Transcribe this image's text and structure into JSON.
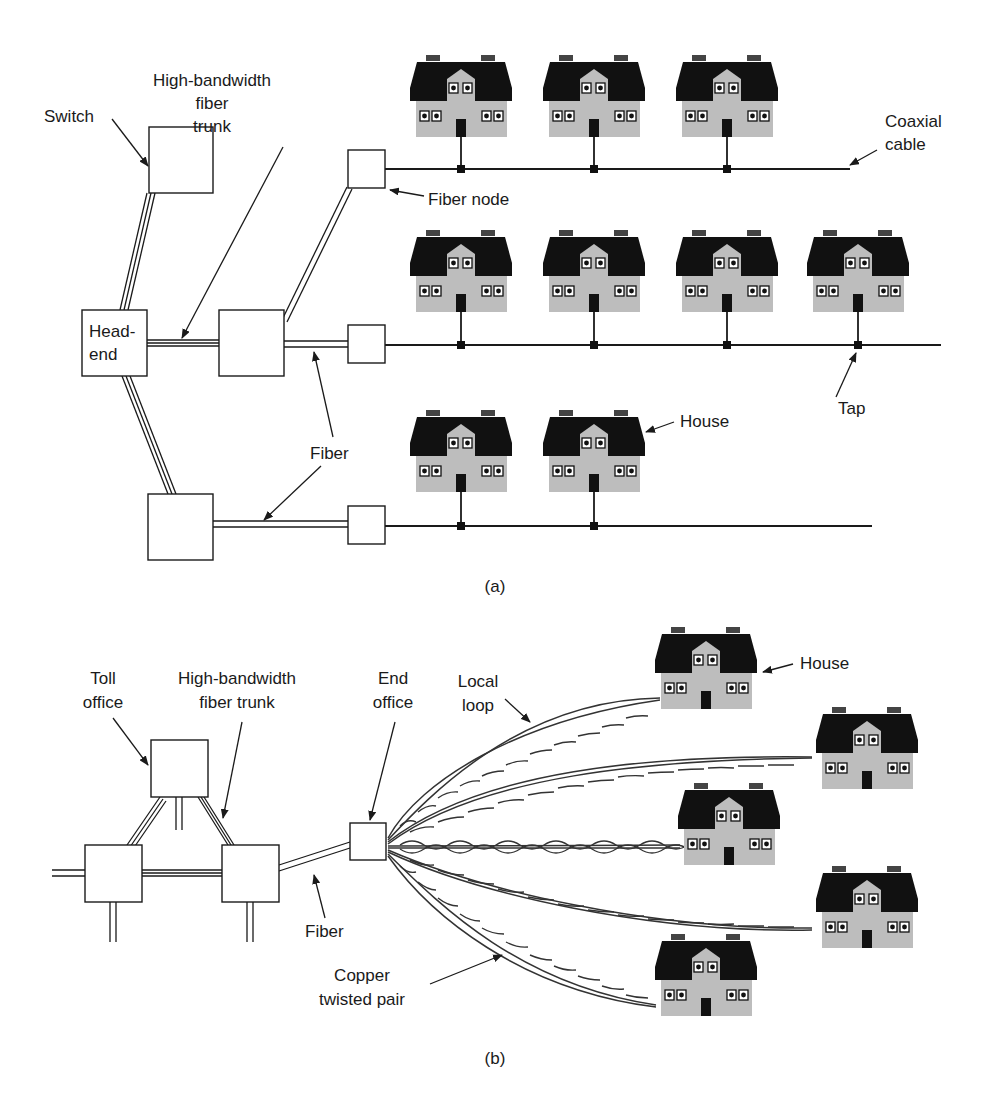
{
  "figure": {
    "panel_a": {
      "caption": "(a)",
      "labels": {
        "switch": "Switch",
        "trunk_1": "High-bandwidth",
        "trunk_2": "fiber",
        "trunk_3": "trunk",
        "headend_1": "Head-",
        "headend_2": "end",
        "fiber_node": "Fiber node",
        "coax_1": "Coaxial",
        "coax_2": "cable",
        "fiber": "Fiber",
        "tap": "Tap",
        "house": "House"
      },
      "rows": [
        {
          "name": "row-1",
          "houses": 3
        },
        {
          "name": "row-2",
          "houses": 4
        },
        {
          "name": "row-3",
          "houses": 2
        }
      ]
    },
    "panel_b": {
      "caption": "(b)",
      "labels": {
        "toll_1": "Toll",
        "toll_2": "office",
        "trunk_1": "High-bandwidth",
        "trunk_2": "fiber trunk",
        "end_1": "End",
        "end_2": "office",
        "loop_1": "Local",
        "loop_2": "loop",
        "house": "House",
        "fiber": "Fiber",
        "copper_1": "Copper",
        "copper_2": "twisted pair"
      },
      "houses": 5
    },
    "colors": {
      "ink": "#1a1a1a",
      "roof": "#111111",
      "wall": "#bdbdbd",
      "background": "#ffffff"
    }
  }
}
